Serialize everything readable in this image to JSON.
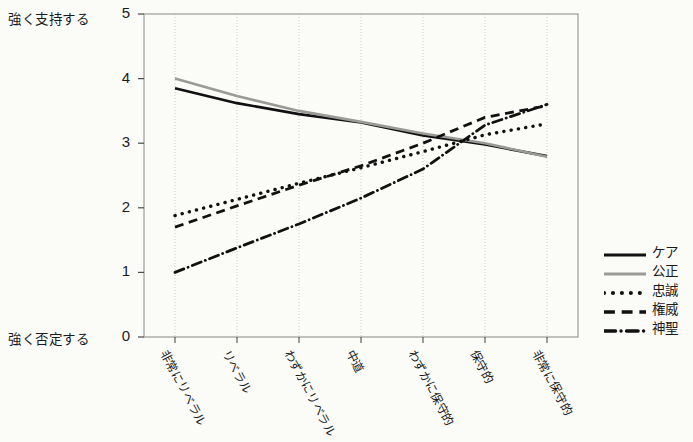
{
  "chart_data": {
    "type": "line",
    "title": "",
    "xlabel": "",
    "ylabel": "",
    "ylim": [
      0,
      5
    ],
    "grid": "vertical",
    "legend_position": "right",
    "axis_endpoint_labels": {
      "top": "強く支持する",
      "bottom": "強く否定する"
    },
    "ytick_labels": [
      "0",
      "1",
      "2",
      "3",
      "4",
      "5"
    ],
    "ytick_values": [
      0,
      1,
      2,
      3,
      4,
      5
    ],
    "categories": [
      "非常にリベラル",
      "リベラル",
      "わずかにリベラル",
      "中道",
      "わずかに保守的",
      "保守的",
      "非常に保守的"
    ],
    "series": [
      {
        "name": "ケア",
        "style": "solid",
        "color": "#111111",
        "values": [
          3.85,
          3.62,
          3.45,
          3.32,
          3.12,
          2.98,
          2.8
        ]
      },
      {
        "name": "公正",
        "style": "solid",
        "color": "#9a9a96",
        "values": [
          4.0,
          3.73,
          3.5,
          3.33,
          3.15,
          3.0,
          2.79
        ]
      },
      {
        "name": "忠誠",
        "style": "dotted",
        "color": "#111111",
        "values": [
          1.88,
          2.13,
          2.38,
          2.62,
          2.87,
          3.13,
          3.3
        ]
      },
      {
        "name": "権威",
        "style": "dashed",
        "color": "#111111",
        "values": [
          1.7,
          2.03,
          2.35,
          2.65,
          3.0,
          3.4,
          3.58
        ]
      },
      {
        "name": "神聖",
        "style": "dash-dot",
        "color": "#111111",
        "values": [
          1.0,
          1.38,
          1.75,
          2.15,
          2.6,
          3.28,
          3.6
        ]
      }
    ]
  },
  "legend": {
    "items": [
      {
        "label": "ケア"
      },
      {
        "label": "公正"
      },
      {
        "label": "忠誠"
      },
      {
        "label": "権威"
      },
      {
        "label": "神聖"
      }
    ]
  },
  "colors": {
    "ink": "#111111",
    "gray_series": "#9a9a96",
    "frame": "#9c9c98",
    "gridline": "#c9c9c4",
    "page_background": "#fbfbf8"
  }
}
